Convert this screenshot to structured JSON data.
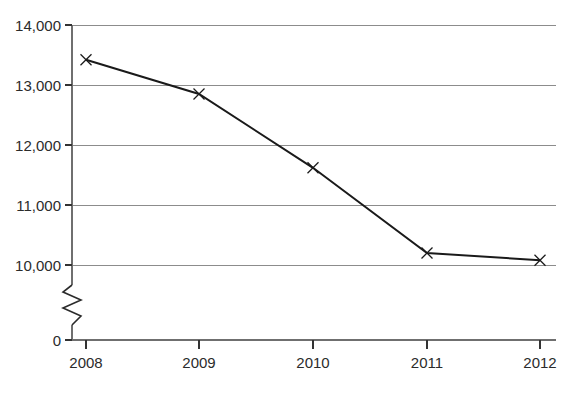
{
  "chart_data": {
    "type": "line",
    "title": "",
    "subtitle": "",
    "xlabel": "",
    "ylabel": "",
    "categories": [
      "2008",
      "2009",
      "2010",
      "2011",
      "2012"
    ],
    "values": [
      13420,
      12850,
      11620,
      10200,
      10080
    ],
    "series": [
      {
        "name": "",
        "values": [
          13420,
          12850,
          11620,
          10200,
          10080
        ]
      }
    ],
    "ylim": [
      10000,
      14000
    ],
    "y_ticks": [
      10000,
      11000,
      12000,
      13000,
      14000
    ],
    "y_tick_labels": [
      "10,000",
      "11,000",
      "12,000",
      "13,000",
      "14,000"
    ],
    "zero_label": "0",
    "axis_break": true,
    "grid": true,
    "grid_axis": "y",
    "legend": false,
    "legend_position": "none",
    "marker_style": "x",
    "line_color": "#1a1a1a",
    "grid_color": "#8c8c8c",
    "axis_color": "#6f6f6f",
    "background_color": "#ffffff"
  },
  "axes": {
    "y_labels": [
      "14,000",
      "13,000",
      "12,000",
      "11,000",
      "10,000"
    ],
    "zero": "0",
    "x_labels": [
      "2008",
      "2009",
      "2010",
      "2011",
      "2012"
    ]
  }
}
